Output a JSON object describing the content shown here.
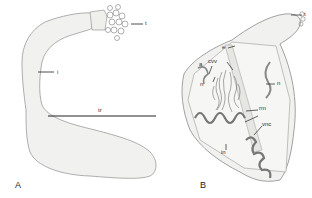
{
  "figure": {
    "panels": [
      {
        "id": "A",
        "label": "A",
        "labels": {
          "t": "t",
          "i": "i",
          "tr": "tr"
        }
      },
      {
        "id": "B",
        "label": "B",
        "labels": {
          "t": "t",
          "e": "e",
          "a": "a",
          "cvv": "cvv",
          "n1": "n",
          "n2": "n",
          "rm": "rm",
          "vnc": "vnc",
          "in": "in"
        }
      }
    ],
    "colors": {
      "body_fill": "#f1f1ef",
      "outline": "#9a9a9a",
      "line": "#222222"
    }
  }
}
